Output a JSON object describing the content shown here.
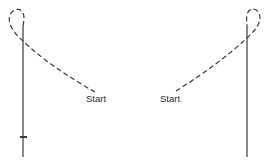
{
  "diagram": {
    "left_figure": {
      "start_label": "Start",
      "has_tick_mark": true
    },
    "right_figure": {
      "start_label": "Start",
      "has_tick_mark": false
    },
    "colors": {
      "stroke": "#3a3a3a",
      "background": "#ffffff"
    }
  }
}
